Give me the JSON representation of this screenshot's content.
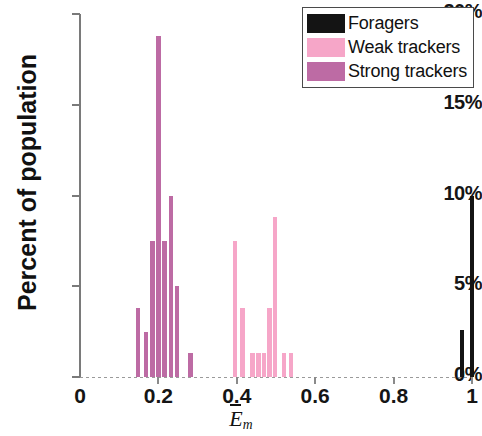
{
  "chart_data": {
    "type": "bar",
    "title": "",
    "subtitle": "",
    "xlabel": "Ēm",
    "xlabel_base": "E",
    "xlabel_sub": "m",
    "ylabel": "Percent of population",
    "xlim": [
      0,
      1.0
    ],
    "ylim": [
      0,
      20
    ],
    "grid": false,
    "legend_position": "top-right",
    "xticks": [
      0,
      0.2,
      0.4,
      0.6,
      0.8,
      1
    ],
    "xtick_labels": [
      "0",
      "0.2",
      "0.4",
      "0.6",
      "0.8",
      "1"
    ],
    "yticks": [
      0,
      5,
      10,
      15,
      20
    ],
    "ytick_labels": [
      "0%",
      "5%",
      "10%",
      "15%",
      "20%"
    ],
    "bar_width": 0.0115,
    "series": [
      {
        "name": "Foragers",
        "color": "#141414",
        "points": [
          {
            "x": 0.975,
            "y": 2.6
          },
          {
            "x": 1.0,
            "y": 10.0
          }
        ]
      },
      {
        "name": "Weak trackers",
        "color": "#f6a6c8",
        "points": [
          {
            "x": 0.395,
            "y": 7.5
          },
          {
            "x": 0.415,
            "y": 3.8
          },
          {
            "x": 0.44,
            "y": 1.3
          },
          {
            "x": 0.455,
            "y": 1.3
          },
          {
            "x": 0.47,
            "y": 1.3
          },
          {
            "x": 0.483,
            "y": 3.8
          },
          {
            "x": 0.498,
            "y": 8.8
          },
          {
            "x": 0.52,
            "y": 1.3
          },
          {
            "x": 0.538,
            "y": 1.3
          }
        ]
      },
      {
        "name": "Strong trackers",
        "color": "#bd6ba4",
        "points": [
          {
            "x": 0.148,
            "y": 3.8
          },
          {
            "x": 0.168,
            "y": 2.5
          },
          {
            "x": 0.185,
            "y": 7.5
          },
          {
            "x": 0.2,
            "y": 18.8
          },
          {
            "x": 0.215,
            "y": 7.5
          },
          {
            "x": 0.232,
            "y": 10.0
          },
          {
            "x": 0.248,
            "y": 5.0
          },
          {
            "x": 0.282,
            "y": 1.3
          }
        ]
      }
    ]
  },
  "legend": {
    "items": [
      {
        "label": "Foragers",
        "key": "forager"
      },
      {
        "label": "Weak trackers",
        "key": "weak"
      },
      {
        "label": "Strong trackers",
        "key": "strong"
      }
    ]
  },
  "colors": {
    "forager": "#141414",
    "weak": "#f6a6c8",
    "strong": "#bd6ba4",
    "axis": "#7a7a7a",
    "text": "#111111"
  }
}
